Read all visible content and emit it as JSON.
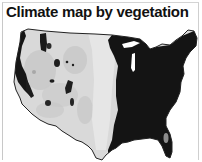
{
  "title": "Climate map by vegetation",
  "map": {
    "region": "contiguous-united-states",
    "colors": {
      "arid_west": "#d8d8d8",
      "arid_west_texture": "#bdbdbd",
      "humid_east": "#141414",
      "mountain_forest": "#1e1e1e",
      "outline": "#222222",
      "background": "#ffffff"
    },
    "zones": [
      {
        "name": "humid-east",
        "shade": "black"
      },
      {
        "name": "arid-west",
        "shade": "light-gray"
      },
      {
        "name": "mountain-forests",
        "shade": "dark"
      },
      {
        "name": "pacific-northwest-coast",
        "shade": "dark"
      }
    ]
  }
}
